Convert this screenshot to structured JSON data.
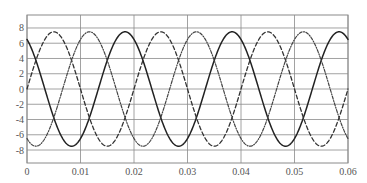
{
  "chart_data": {
    "type": "line",
    "title": "",
    "xlabel": "",
    "ylabel": "",
    "xlim": [
      0,
      0.06
    ],
    "ylim": [
      -9.7,
      9.7
    ],
    "grid": true,
    "legend": null,
    "x_ticks": [
      0,
      0.01,
      0.02,
      0.03,
      0.04,
      0.05,
      0.06
    ],
    "x_tick_labels": [
      "0",
      "0.01",
      "0.02",
      "0.03",
      "0.04",
      "0.05",
      "0.06"
    ],
    "y_ticks": [
      8,
      6,
      4,
      2,
      0,
      -2,
      -4,
      -6,
      -8
    ],
    "y_tick_labels": [
      "8",
      "6",
      "4",
      "2",
      "0",
      "-2",
      "-4",
      "-6",
      "-8"
    ],
    "series": [
      {
        "name": "phase-b",
        "style": "solid",
        "color": "#222222",
        "function": "7.5*sin(2*pi*50*t + 120deg)",
        "amplitude": 7.5,
        "frequency_hz": 50,
        "phase_deg": 120,
        "sample_points": [
          [
            0,
            6.5
          ],
          [
            0.00333,
            0
          ],
          [
            0.00833,
            -7.5
          ],
          [
            0.01333,
            0
          ],
          [
            0.01833,
            7.5
          ],
          [
            0.02333,
            0
          ],
          [
            0.02833,
            -7.5
          ],
          [
            0.03833,
            7.5
          ],
          [
            0.04833,
            -7.5
          ],
          [
            0.05833,
            7.5
          ],
          [
            0.06,
            6.5
          ]
        ]
      },
      {
        "name": "phase-a",
        "style": "dashed",
        "color": "#333333",
        "function": "7.5*sin(2*pi*50*t)",
        "amplitude": 7.5,
        "frequency_hz": 50,
        "phase_deg": 0,
        "sample_points": [
          [
            0,
            0
          ],
          [
            0.005,
            7.5
          ],
          [
            0.01,
            0
          ],
          [
            0.015,
            -7.5
          ],
          [
            0.02,
            0
          ],
          [
            0.025,
            7.5
          ],
          [
            0.035,
            -7.5
          ],
          [
            0.045,
            7.5
          ],
          [
            0.055,
            -7.5
          ],
          [
            0.06,
            0
          ]
        ]
      },
      {
        "name": "phase-c",
        "style": "dash-dot",
        "color": "#444444",
        "function": "7.5*sin(2*pi*50*t - 120deg)",
        "amplitude": 7.5,
        "frequency_hz": 50,
        "phase_deg": -120,
        "sample_points": [
          [
            0,
            -6.5
          ],
          [
            0.00167,
            -7.5
          ],
          [
            0.00667,
            0
          ],
          [
            0.01167,
            7.5
          ],
          [
            0.02167,
            -7.5
          ],
          [
            0.03167,
            7.5
          ],
          [
            0.04167,
            -7.5
          ],
          [
            0.05167,
            7.5
          ],
          [
            0.06,
            -6.5
          ]
        ]
      }
    ]
  },
  "layout": {
    "plot": {
      "left": 27,
      "right": 348,
      "top": 15,
      "bottom": 163
    }
  }
}
